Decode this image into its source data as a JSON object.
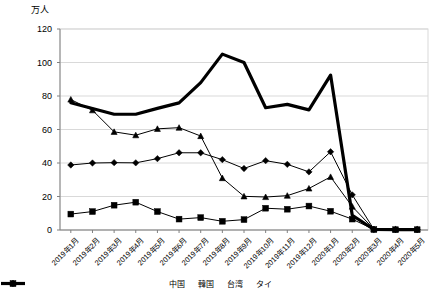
{
  "chart_data": {
    "type": "line",
    "title": "",
    "subtitle": "",
    "ylabel": "万人",
    "xlabel": "",
    "ylim": [
      0,
      120
    ],
    "ytick_step": 20,
    "ytick_labels": [
      "120",
      "100",
      "80",
      "60",
      "40",
      "20",
      "0"
    ],
    "grid": true,
    "legend_position": "bottom",
    "categories": [
      "2019年1月",
      "2019年2月",
      "2019年3月",
      "2019年4月",
      "2019年5月",
      "2019年6月",
      "2019年7月",
      "2019年8月",
      "2019年9月",
      "2019年10月",
      "2019年11月",
      "2019年12月",
      "2020年1月",
      "2020年2月",
      "2020年3月",
      "2020年4月",
      "2020年5月"
    ],
    "series": [
      {
        "name": "中国",
        "marker": "none",
        "color": "#000000",
        "width": 3.2,
        "values": [
          76,
          72.5,
          69.1,
          69.1,
          72.6,
          75.9,
          88.0,
          105.0,
          100.0,
          73.0,
          75.0,
          71.7,
          92.5,
          8.8,
          0.3,
          0.2,
          0.2
        ]
      },
      {
        "name": "韓国",
        "marker": "triangle",
        "color": "#000000",
        "width": 1.0,
        "values": [
          77.9,
          71.5,
          58.6,
          56.6,
          60.4,
          61.1,
          56.1,
          31.0,
          20.1,
          19.7,
          20.5,
          24.8,
          31.7,
          14.0,
          0.5,
          0.3,
          0.3
        ]
      },
      {
        "name": "台湾",
        "marker": "diamond",
        "color": "#000000",
        "width": 1.0,
        "values": [
          38.8,
          40.0,
          40.2,
          40.1,
          42.6,
          46.1,
          46.1,
          42.0,
          36.7,
          41.4,
          39.2,
          34.7,
          46.7,
          21.0,
          0.4,
          0.3,
          0.3
        ]
      },
      {
        "name": "タイ",
        "marker": "square",
        "color": "#000000",
        "width": 1.0,
        "values": [
          9.5,
          11.0,
          14.8,
          16.6,
          11.0,
          6.5,
          7.4,
          5.2,
          6.2,
          13.0,
          12.4,
          14.3,
          11.2,
          6.5,
          0.3,
          0.2,
          0.2
        ]
      }
    ]
  },
  "legend": {
    "items": [
      {
        "label": "中国",
        "marker": "none"
      },
      {
        "label": "韓国",
        "marker": "triangle"
      },
      {
        "label": "台湾",
        "marker": "diamond"
      },
      {
        "label": "タイ",
        "marker": "square"
      }
    ]
  }
}
